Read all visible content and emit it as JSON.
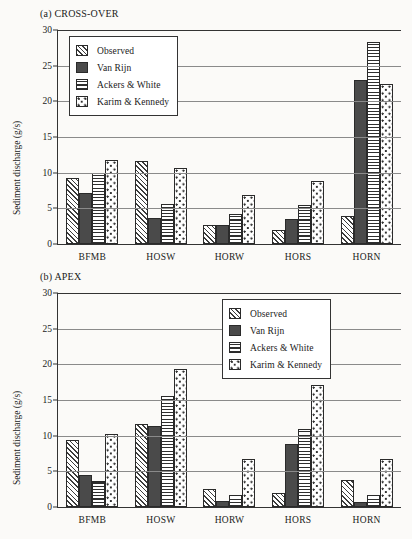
{
  "figure": {
    "background_color": "#fbfaf8",
    "axis_color": "#333333",
    "gridline_color": "#8a8a8a"
  },
  "series_styles": [
    {
      "name": "Observed",
      "pattern": "diagonal-hatch",
      "color": "#3c3c3c"
    },
    {
      "name": "Van Rijn",
      "pattern": "solid-fill",
      "color": "#4a4a4a"
    },
    {
      "name": "Ackers & White",
      "pattern": "horizontal-lines",
      "color": "#2f2f2f"
    },
    {
      "name": "Karim & Kennedy",
      "pattern": "dotted-checker",
      "color": "#2f2f2f"
    }
  ],
  "chart_data": [
    {
      "type": "bar",
      "title": "(a) CROSS-OVER",
      "xlabel": "",
      "ylabel": "Sediment discharge (g/s)",
      "ylim": [
        0,
        30
      ],
      "yticks": [
        0,
        5,
        10,
        15,
        20,
        25,
        30
      ],
      "ytick_labels": [
        "0",
        "5",
        "10",
        "15",
        "20",
        "25",
        "30"
      ],
      "grid": true,
      "legend_position": "top-left",
      "categories": [
        "BFMB",
        "HOSW",
        "HORW",
        "HORS",
        "HORN"
      ],
      "series": [
        {
          "name": "Observed",
          "values": [
            9.3,
            11.7,
            2.6,
            2.0,
            3.9
          ]
        },
        {
          "name": "Van Rijn",
          "values": [
            7.2,
            3.7,
            2.6,
            3.5,
            23.0
          ]
        },
        {
          "name": "Ackers & White",
          "values": [
            10.0,
            5.6,
            4.2,
            5.5,
            28.3
          ]
        },
        {
          "name": "Karim & Kennedy",
          "values": [
            11.8,
            10.7,
            6.9,
            8.9,
            22.4
          ]
        }
      ]
    },
    {
      "type": "bar",
      "title": "(b) APEX",
      "xlabel": "",
      "ylabel": "Sediment discharge (g/s)",
      "ylim": [
        0,
        30
      ],
      "yticks": [
        0,
        5,
        10,
        15,
        20,
        25,
        30
      ],
      "ytick_labels": [
        "0",
        "5",
        "10",
        "15",
        "20",
        "25",
        "30"
      ],
      "grid": true,
      "legend_position": "top-right",
      "categories": [
        "BFMB",
        "HOSW",
        "HORW",
        "HORS",
        "HORN"
      ],
      "series": [
        {
          "name": "Observed",
          "values": [
            9.4,
            11.6,
            2.5,
            1.9,
            3.8
          ]
        },
        {
          "name": "Van Rijn",
          "values": [
            4.5,
            11.3,
            0.9,
            8.8,
            0.7
          ]
        },
        {
          "name": "Ackers & White",
          "values": [
            3.6,
            15.6,
            1.7,
            10.9,
            1.7
          ]
        },
        {
          "name": "Karim & Kennedy",
          "values": [
            10.3,
            19.4,
            6.7,
            17.1,
            6.7
          ]
        }
      ]
    }
  ]
}
